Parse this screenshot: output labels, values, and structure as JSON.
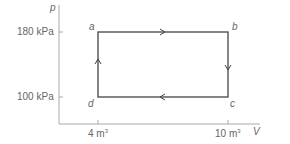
{
  "diagram": {
    "type": "pV-cycle",
    "axes": {
      "y_label": "p",
      "x_label": "V",
      "y_ticks": [
        "180 kPa",
        "100 kPa"
      ],
      "x_ticks": [
        {
          "value": "4 m",
          "unit_exp": "3"
        },
        {
          "value": "10 m",
          "unit_exp": "3"
        }
      ]
    },
    "points": [
      {
        "name": "a",
        "V": 4,
        "p": 180
      },
      {
        "name": "b",
        "V": 10,
        "p": 180
      },
      {
        "name": "c",
        "V": 10,
        "p": 100
      },
      {
        "name": "d",
        "V": 4,
        "p": 100
      }
    ],
    "path_direction": [
      "a→b",
      "b→c",
      "c→d",
      "d→a"
    ],
    "colors": {
      "line": "#333333",
      "axis": "#999999",
      "text": "#666666"
    }
  }
}
